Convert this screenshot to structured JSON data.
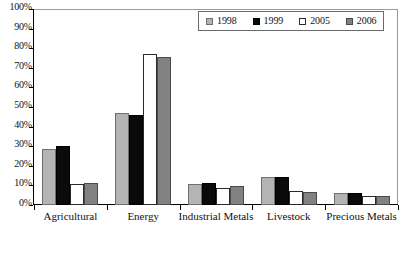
{
  "chart_data": {
    "type": "bar",
    "title": "",
    "xlabel": "",
    "ylabel": "",
    "ylim": [
      0,
      100
    ],
    "ytick_labels": [
      "100%",
      "90%",
      "80%",
      "70%",
      "60%",
      "50%",
      "40%",
      "30%",
      "20%",
      "10%",
      "0%"
    ],
    "ytick_values": [
      100,
      90,
      80,
      70,
      60,
      50,
      40,
      30,
      20,
      10,
      0
    ],
    "grid": false,
    "legend_position": "top-right",
    "categories": [
      "Agricultural",
      "Energy",
      "Industrial Metals",
      "Livestock",
      "Precious Metals"
    ],
    "series": [
      {
        "name": "1998",
        "color": "#b4b4b4",
        "values": [
          28.7,
          47.0,
          10.6,
          14.1,
          6.0
        ]
      },
      {
        "name": "1999",
        "color": "#0a0a0a",
        "values": [
          30.2,
          45.7,
          11.0,
          14.2,
          6.2
        ]
      },
      {
        "name": "2005",
        "color": "#ffffff",
        "values": [
          10.5,
          77.0,
          8.8,
          7.0,
          4.4
        ]
      },
      {
        "name": "2006",
        "color": "#828282",
        "values": [
          11.4,
          75.5,
          9.8,
          6.7,
          4.6
        ]
      }
    ]
  },
  "legend": {
    "items": [
      {
        "label": "1998",
        "swatch": "legend-swatch-1998"
      },
      {
        "label": "1999",
        "swatch": "legend-swatch-1999"
      },
      {
        "label": "2005",
        "swatch": "legend-swatch-2005"
      },
      {
        "label": "2006",
        "swatch": "legend-swatch-2006"
      }
    ]
  }
}
